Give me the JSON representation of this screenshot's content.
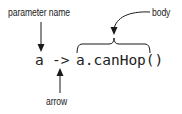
{
  "diagram": {
    "labels": {
      "parameter_name": "parameter name",
      "body": "body",
      "arrow": "arrow"
    },
    "code": {
      "parameter": "a",
      "arrow_token": "->",
      "body_expression": "a.canHop()"
    },
    "colors": {
      "text": "#1a1a1a",
      "lines": "#1a1a1a",
      "background": "#ffffff"
    }
  }
}
